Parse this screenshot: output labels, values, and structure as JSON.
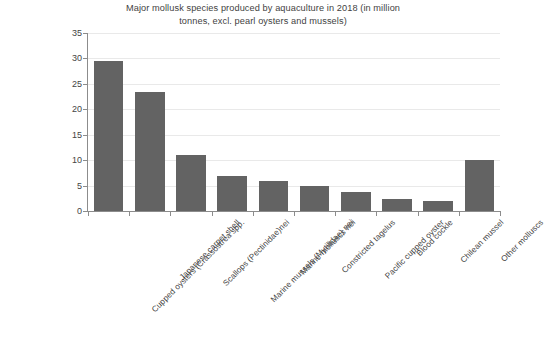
{
  "chart_data": {
    "type": "bar",
    "title": "Major mollusk species produced by aquaculture in 2018 (in million tonnes, excl. pearl oysters and mussels)",
    "title_lines": [
      "Major mollusk species produced by aquaculture in 2018 (in million",
      "tonnes, excl. pearl oysters and mussels)"
    ],
    "xlabel": "",
    "ylabel": "",
    "ylim": [
      0,
      35
    ],
    "ytick_step": 5,
    "yticks": [
      "0",
      "5",
      "10",
      "15",
      "20",
      "25",
      "30",
      "35"
    ],
    "grid": true,
    "legend": false,
    "bar_color": "#636363",
    "gridline_color": "#e9e9e9",
    "axis_color": "#8c8c8c",
    "background_color": "#ffffff",
    "categories": [
      "Cupped oysters (Crassostrea spp.",
      "Japanese carpet shell",
      "Scallops (Pectinidae)nei",
      "Marine mussels (Mytilidae) nei",
      "Marine molluscs nei",
      "Constricted tagelus",
      "Pacific cupped oyster",
      "Blood cockle",
      "Chilean mussel",
      "Other molluscs"
    ],
    "values": [
      29.5,
      23.5,
      11.0,
      6.8,
      5.9,
      4.9,
      3.7,
      2.4,
      1.9,
      10.0
    ]
  }
}
